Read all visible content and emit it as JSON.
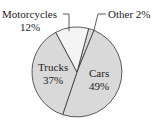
{
  "chart_data": {
    "type": "pie",
    "title": "",
    "categories": [
      "Cars",
      "Trucks",
      "Motorcycles",
      "Other"
    ],
    "values": [
      49,
      37,
      12,
      2
    ],
    "unit": "%",
    "labels": {
      "cars": {
        "name": "Cars",
        "value": "49%"
      },
      "trucks": {
        "name": "Trucks",
        "value": "37%"
      },
      "motorcycles": {
        "name": "Motorcycles",
        "value": "12%"
      },
      "other": {
        "name": "Other",
        "value": "2%",
        "text": "Other 2%"
      }
    },
    "colors": {
      "cars": "#d9d9d9",
      "trucks": "#d9d9d9",
      "motorcycles": "#f4f4f4",
      "other": "#d9d9d9",
      "stroke": "#333333"
    },
    "legend": "none",
    "grid": false
  }
}
